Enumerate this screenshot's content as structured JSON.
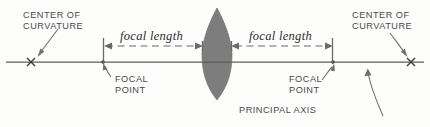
{
  "diagram": {
    "labels": {
      "center_of_curvature_left_line1": "CENTER OF",
      "center_of_curvature_left_line2": "CURVATURE",
      "center_of_curvature_right_line1": "CENTER OF",
      "center_of_curvature_right_line2": "CURVATURE",
      "focal_length_left": "focal length",
      "focal_length_right": "focal length",
      "focal_point_left_line1": "FOCAL",
      "focal_point_left_line2": "POINT",
      "focal_point_right_line1": "FOCAL",
      "focal_point_right_line2": "POINT",
      "principal_axis": "PRINCIPAL AXIS"
    },
    "colors": {
      "background": "#fdfdfc",
      "lens_fill": "#7d7d7d",
      "axis_stroke": "#5c5c5c",
      "dimension_stroke": "#6a6a6a",
      "label_text": "#4a4a4a",
      "focal_text": "#2d2d2d",
      "mark_stroke": "#3d3d3d"
    },
    "geometry": {
      "axis_y": 62,
      "axis_x_start": 6,
      "axis_x_end": 424,
      "lens_center_x": 217,
      "lens_half_width": 15,
      "lens_top_y": 8,
      "lens_bottom_y": 100,
      "focal_point_left_x": 103,
      "focal_point_right_x": 333,
      "center_curvature_left_x": 31,
      "center_curvature_right_x": 411,
      "dimension_y": 46
    }
  }
}
